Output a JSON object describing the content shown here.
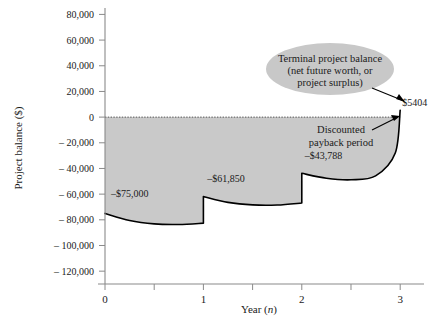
{
  "chart_data": {
    "type": "area",
    "title": "",
    "xlabel": "Year (n)",
    "ylabel": "Project balance ($)",
    "xlim": [
      0,
      3.12
    ],
    "ylim": [
      -130000,
      85000
    ],
    "grid": false,
    "legend": null,
    "y_ticks": [
      {
        "value": 80000,
        "label": "80,000"
      },
      {
        "value": 60000,
        "label": "60,000"
      },
      {
        "value": 40000,
        "label": "40,000"
      },
      {
        "value": 20000,
        "label": "20,000"
      },
      {
        "value": 0,
        "label": "0"
      },
      {
        "value": -20000,
        "label": "– 20,000"
      },
      {
        "value": -40000,
        "label": "– 40,000"
      },
      {
        "value": -60000,
        "label": "– 60,000"
      },
      {
        "value": -80000,
        "label": "– 80,000"
      },
      {
        "value": -100000,
        "label": "– 100,000"
      },
      {
        "value": -120000,
        "label": "– 120,000"
      }
    ],
    "x_ticks": [
      {
        "value": 0,
        "label": "0"
      },
      {
        "value": 0.5,
        "label": ""
      },
      {
        "value": 1,
        "label": "1"
      },
      {
        "value": 1.5,
        "label": ""
      },
      {
        "value": 2,
        "label": "2"
      },
      {
        "value": 2.5,
        "label": ""
      },
      {
        "value": 3,
        "label": "3"
      }
    ],
    "zero_line": {
      "value": 0,
      "style": "dotted"
    },
    "series": [
      {
        "name": "Project balance",
        "points": [
          {
            "x": 0.0,
            "y": -75000
          },
          {
            "x": 0.25,
            "y": -80600
          },
          {
            "x": 0.5,
            "y": -83200
          },
          {
            "x": 0.75,
            "y": -83600
          },
          {
            "x": 1.0,
            "y": -82600
          },
          {
            "x": 1.0,
            "y": -61850
          },
          {
            "x": 1.25,
            "y": -66400
          },
          {
            "x": 1.5,
            "y": -68400
          },
          {
            "x": 1.75,
            "y": -68500
          },
          {
            "x": 2.0,
            "y": -66900
          },
          {
            "x": 2.0,
            "y": -43788
          },
          {
            "x": 2.25,
            "y": -47600
          },
          {
            "x": 2.5,
            "y": -48800
          },
          {
            "x": 2.75,
            "y": -45800
          },
          {
            "x": 2.95,
            "y": -28000
          },
          {
            "x": 3.0,
            "y": 5404
          }
        ]
      }
    ],
    "data_labels": [
      {
        "text": "–$75,000",
        "x": 0.06,
        "y": -62000
      },
      {
        "text": "–$61,850",
        "x": 1.04,
        "y": -50500
      },
      {
        "text": "–$43,788",
        "x": 2.03,
        "y": -33000
      },
      {
        "text": "$5404",
        "x": 3.02,
        "y": 9000
      }
    ],
    "annotations": [
      {
        "name": "terminal-project-balance-callout",
        "lines": [
          "Terminal project balance",
          "(net future worth, or",
          "project surplus)"
        ],
        "shape": "ellipse",
        "arrow_to": {
          "x": 3.0,
          "y": 2000
        }
      },
      {
        "name": "discounted-payback-period-callout",
        "lines": [
          "Discounted",
          "payback period"
        ],
        "shape": "text",
        "arrow_to": {
          "x": 2.93,
          "y": -1500
        }
      }
    ],
    "colors": {
      "area_fill": "#c9c9c9",
      "curve": "#000000",
      "axis": "#808080",
      "text": "#1a1a1a",
      "ellipse_fill": "#c8c8c8",
      "zero_line": "#555555"
    }
  },
  "figure": {
    "y_axis_title": "Project balance ($)",
    "x_axis_title_prefix": "Year (",
    "x_axis_title_var": "n",
    "x_axis_title_suffix": ")"
  }
}
